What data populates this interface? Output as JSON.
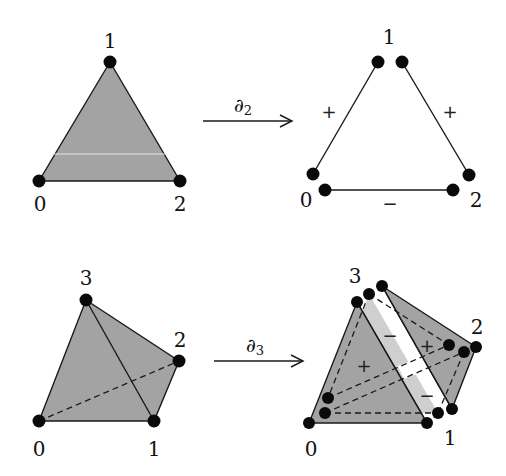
{
  "colors": {
    "face_dark": "#a3a3a3",
    "face_light": "#cfcfcf",
    "stroke": "#1a1a1a",
    "background": "#ffffff"
  },
  "top_row": {
    "simplex": {
      "vertex_labels": [
        "0",
        "1",
        "2"
      ],
      "vertices": [
        [
          39,
          181
        ],
        [
          110,
          62
        ],
        [
          180,
          181
        ]
      ]
    },
    "operator": {
      "symbol": "∂",
      "subscript": "2",
      "arrow": [
        [
          203,
          121
        ],
        [
          292,
          121
        ]
      ]
    },
    "boundary": {
      "vertex_labels": [
        "0",
        "1",
        "2"
      ],
      "edge_signs": [
        "+",
        "+",
        "−"
      ]
    }
  },
  "bottom_row": {
    "simplex": {
      "vertex_labels": [
        "0",
        "1",
        "2",
        "3"
      ],
      "vertices": [
        [
          39,
          421
        ],
        [
          154,
          421
        ],
        [
          179,
          361
        ],
        [
          86,
          300
        ]
      ]
    },
    "operator": {
      "symbol": "∂",
      "subscript": "3",
      "arrow": [
        [
          208,
          361
        ],
        [
          303,
          361
        ]
      ]
    },
    "boundary": {
      "vertex_labels": [
        "0",
        "1",
        "2",
        "3"
      ],
      "face_signs": [
        "+",
        "−",
        "+",
        "−"
      ]
    }
  }
}
